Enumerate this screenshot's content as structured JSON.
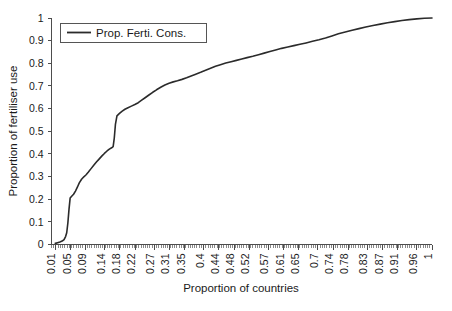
{
  "chart_data": {
    "type": "line",
    "title": "",
    "xlabel": "Proportion of countries",
    "ylabel": "Proportion of fertiliser use",
    "xlim": [
      0,
      1
    ],
    "ylim": [
      0,
      1
    ],
    "grid": false,
    "legend_position": "top-left",
    "legend_entries": [
      "Prop. Ferti. Cons."
    ],
    "xtick_labels": [
      "0.01",
      "0.05",
      "0.09",
      "0.14",
      "0.18",
      "0.22",
      "0.27",
      "0.31",
      "0.35",
      "0.4",
      "0.44",
      "0.48",
      "0.52",
      "0.57",
      "0.61",
      "0.65",
      "0.7",
      "0.74",
      "0.78",
      "0.83",
      "0.87",
      "0.91",
      "0.96",
      "1"
    ],
    "xtick_values": [
      0.01,
      0.05,
      0.09,
      0.14,
      0.18,
      0.22,
      0.27,
      0.31,
      0.35,
      0.4,
      0.44,
      0.48,
      0.52,
      0.57,
      0.61,
      0.65,
      0.7,
      0.74,
      0.78,
      0.83,
      0.87,
      0.91,
      0.96,
      1
    ],
    "ytick_labels": [
      "0",
      "0.1",
      "0.2",
      "0.3",
      "0.4",
      "0.5",
      "0.6",
      "0.7",
      "0.8",
      "0.9",
      "1"
    ],
    "ytick_values": [
      0,
      0.1,
      0.2,
      0.3,
      0.4,
      0.5,
      0.6,
      0.7,
      0.8,
      0.9,
      1
    ],
    "series": [
      {
        "name": "Prop. Ferti. Cons.",
        "color": "#2b2b2b",
        "x": [
          0.01,
          0.016,
          0.022,
          0.028,
          0.033,
          0.037,
          0.04,
          0.043,
          0.046,
          0.049,
          0.053,
          0.058,
          0.063,
          0.068,
          0.073,
          0.079,
          0.085,
          0.091,
          0.097,
          0.104,
          0.111,
          0.118,
          0.125,
          0.132,
          0.139,
          0.146,
          0.152,
          0.158,
          0.162,
          0.165,
          0.168,
          0.172,
          0.178,
          0.185,
          0.193,
          0.201,
          0.21,
          0.219,
          0.228,
          0.237,
          0.246,
          0.256,
          0.266,
          0.276,
          0.287,
          0.298,
          0.309,
          0.32,
          0.331,
          0.343,
          0.355,
          0.367,
          0.379,
          0.392,
          0.405,
          0.418,
          0.431,
          0.444,
          0.458,
          0.472,
          0.486,
          0.5,
          0.514,
          0.529,
          0.544,
          0.559,
          0.574,
          0.589,
          0.605,
          0.621,
          0.637,
          0.653,
          0.669,
          0.686,
          0.703,
          0.72,
          0.737,
          0.754,
          0.772,
          0.79,
          0.808,
          0.826,
          0.845,
          0.864,
          0.883,
          0.902,
          0.921,
          0.94,
          0.96,
          0.98,
          1.0
        ],
        "y": [
          0.005,
          0.008,
          0.011,
          0.015,
          0.022,
          0.035,
          0.052,
          0.095,
          0.155,
          0.205,
          0.213,
          0.222,
          0.236,
          0.253,
          0.272,
          0.288,
          0.299,
          0.308,
          0.32,
          0.335,
          0.35,
          0.364,
          0.377,
          0.39,
          0.402,
          0.413,
          0.421,
          0.427,
          0.432,
          0.47,
          0.53,
          0.568,
          0.578,
          0.588,
          0.597,
          0.604,
          0.611,
          0.618,
          0.626,
          0.637,
          0.648,
          0.66,
          0.672,
          0.683,
          0.694,
          0.704,
          0.712,
          0.718,
          0.723,
          0.729,
          0.736,
          0.744,
          0.752,
          0.76,
          0.769,
          0.778,
          0.787,
          0.794,
          0.801,
          0.807,
          0.813,
          0.819,
          0.825,
          0.831,
          0.838,
          0.845,
          0.852,
          0.859,
          0.866,
          0.872,
          0.878,
          0.884,
          0.89,
          0.897,
          0.904,
          0.912,
          0.921,
          0.93,
          0.938,
          0.946,
          0.953,
          0.96,
          0.967,
          0.973,
          0.979,
          0.984,
          0.989,
          0.993,
          0.996,
          0.999,
          1.0
        ]
      }
    ]
  },
  "legend": {
    "label": "Prop. Ferti. Cons."
  },
  "axes": {
    "x_title": "Proportion of countries",
    "y_title": "Proportion of fertiliser use"
  }
}
